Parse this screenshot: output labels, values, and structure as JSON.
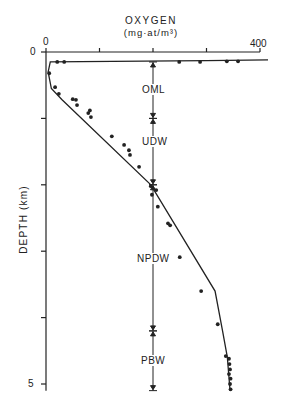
{
  "chart_data": {
    "type": "line",
    "title": "OXYGEN",
    "subtitle": "(mg-at/m3)",
    "xlabel": "Oxygen (mg-at/m3)",
    "ylabel": "DEPTH (km)",
    "x_axis_position": "top",
    "xlim": [
      0,
      400
    ],
    "ylim": [
      5,
      0
    ],
    "y_inverted": true,
    "x_tick_labels": [
      {
        "value": 0,
        "label": "0"
      },
      {
        "value": 400,
        "label": "400"
      }
    ],
    "x_ticks": [
      0,
      100,
      200,
      300,
      400
    ],
    "y_tick_labels": [
      {
        "value": 0,
        "label": "0"
      },
      {
        "value": 5,
        "label": "5"
      }
    ],
    "y_ticks": [
      0,
      1,
      2,
      3,
      4,
      5
    ],
    "grid": false,
    "series": [
      {
        "name": "observations",
        "style": "points",
        "points": [
          {
            "oxygen": 21,
            "depth": 0.15
          },
          {
            "oxygen": 34,
            "depth": 0.15
          },
          {
            "oxygen": 249,
            "depth": 0.15
          },
          {
            "oxygen": 288,
            "depth": 0.15
          },
          {
            "oxygen": 338,
            "depth": 0.14
          },
          {
            "oxygen": 359,
            "depth": 0.14
          },
          {
            "oxygen": 6,
            "depth": 0.32
          },
          {
            "oxygen": 17,
            "depth": 0.53
          },
          {
            "oxygen": 24,
            "depth": 0.63
          },
          {
            "oxygen": 50,
            "depth": 0.71
          },
          {
            "oxygen": 58,
            "depth": 0.8
          },
          {
            "oxygen": 56,
            "depth": 0.72
          },
          {
            "oxygen": 79,
            "depth": 0.92
          },
          {
            "oxygen": 84,
            "depth": 0.98
          },
          {
            "oxygen": 82,
            "depth": 0.88
          },
          {
            "oxygen": 123,
            "depth": 1.27
          },
          {
            "oxygen": 146,
            "depth": 1.4
          },
          {
            "oxygen": 155,
            "depth": 1.48
          },
          {
            "oxygen": 157,
            "depth": 1.55
          },
          {
            "oxygen": 174,
            "depth": 1.73
          },
          {
            "oxygen": 196,
            "depth": 2.02
          },
          {
            "oxygen": 206,
            "depth": 2.08
          },
          {
            "oxygen": 198,
            "depth": 2.15
          },
          {
            "oxygen": 209,
            "depth": 2.33
          },
          {
            "oxygen": 228,
            "depth": 2.58
          },
          {
            "oxygen": 232,
            "depth": 2.61
          },
          {
            "oxygen": 250,
            "depth": 3.09
          },
          {
            "oxygen": 290,
            "depth": 3.6
          },
          {
            "oxygen": 321,
            "depth": 4.1
          },
          {
            "oxygen": 336,
            "depth": 4.58
          },
          {
            "oxygen": 342,
            "depth": 4.62
          },
          {
            "oxygen": 343,
            "depth": 4.7
          },
          {
            "oxygen": 344,
            "depth": 4.78
          },
          {
            "oxygen": 342,
            "depth": 4.85
          },
          {
            "oxygen": 345,
            "depth": 4.92
          },
          {
            "oxygen": 344,
            "depth": 5.0
          },
          {
            "oxygen": 345,
            "depth": 5.08
          }
        ]
      },
      {
        "name": "fitted profile",
        "style": "line",
        "points": [
          {
            "oxygen": 415,
            "depth": 0.12
          },
          {
            "oxygen": 300,
            "depth": 0.13
          },
          {
            "oxygen": 8,
            "depth": 0.15
          },
          {
            "oxygen": 4,
            "depth": 0.3
          },
          {
            "oxygen": 10,
            "depth": 0.55
          },
          {
            "oxygen": 30,
            "depth": 0.72
          },
          {
            "oxygen": 196,
            "depth": 2.0
          },
          {
            "oxygen": 316,
            "depth": 3.6
          },
          {
            "oxygen": 330,
            "depth": 4.2
          },
          {
            "oxygen": 339,
            "depth": 4.6
          },
          {
            "oxygen": 344,
            "depth": 5.1
          }
        ]
      }
    ],
    "annotations": [
      {
        "label": "OML",
        "x": 200,
        "depth_from": 0.15,
        "depth_to": 1.0
      },
      {
        "label": "UDW",
        "x": 200,
        "depth_from": 1.0,
        "depth_to": 2.0
      },
      {
        "label": "NPDW",
        "x": 200,
        "depth_from": 2.0,
        "depth_to": 4.2
      },
      {
        "label": "PBW",
        "x": 200,
        "depth_from": 4.2,
        "depth_to": 5.1
      }
    ]
  },
  "labels": {
    "title": "OXYGEN",
    "subtitle": "(mg·at/m³)",
    "x0": "0",
    "x400": "400",
    "y0": "0",
    "y5": "5",
    "ylabel": "DEPTH (km)",
    "zones": [
      "OML",
      "UDW",
      "NPDW",
      "PBW"
    ]
  }
}
